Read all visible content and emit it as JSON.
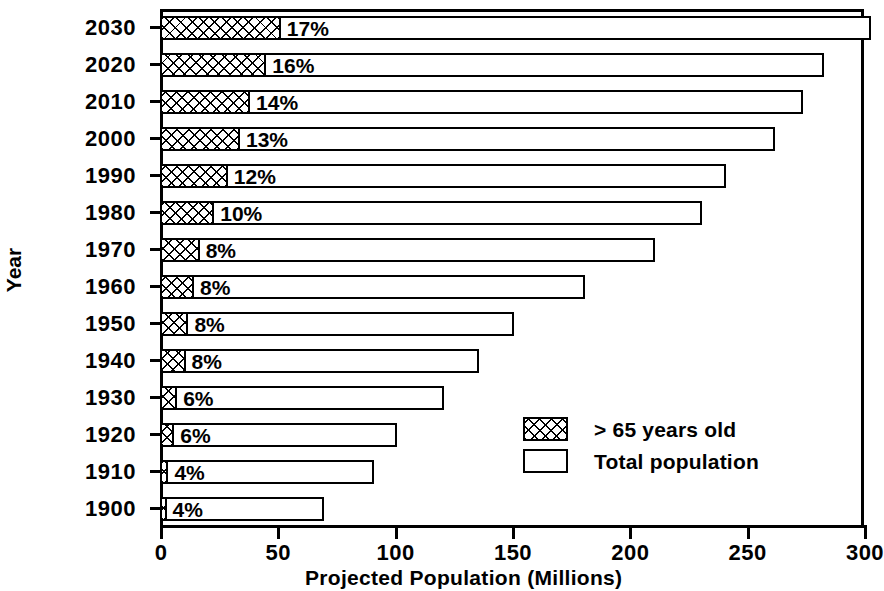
{
  "chart_data": {
    "type": "bar",
    "orientation": "horizontal",
    "title": "",
    "xlabel": "Projected Population (Millions)",
    "ylabel": "Year",
    "xlim": [
      0,
      300
    ],
    "xticks": [
      0,
      50,
      100,
      150,
      200,
      250,
      300
    ],
    "xtick_labels": [
      "0",
      "50",
      "100",
      "150",
      "200",
      "250",
      "300"
    ],
    "grid": false,
    "legend_position": "inside-lower-right",
    "categories": [
      "2030",
      "2020",
      "2010",
      "2000",
      "1990",
      "1980",
      "1970",
      "1960",
      "1950",
      "1940",
      "1930",
      "1920",
      "1910",
      "1900"
    ],
    "series": [
      {
        "name": "Total population",
        "values": [
          303,
          283,
          274,
          262,
          241,
          231,
          211,
          181,
          151,
          136,
          121,
          101,
          91,
          70
        ]
      },
      {
        "name": "> 65 years old",
        "values": [
          51.5,
          45.3,
          38.4,
          34.1,
          28.9,
          23.1,
          16.9,
          14.5,
          12.1,
          10.9,
          7.3,
          6.1,
          3.6,
          2.8
        ]
      }
    ],
    "data_labels": [
      "17%",
      "16%",
      "14%",
      "13%",
      "12%",
      "10%",
      "8%",
      "8%",
      "8%",
      "8%",
      "6%",
      "6%",
      "4%",
      "4%"
    ],
    "bars": [
      {
        "year": "2030",
        "total": 303,
        "elderly": 51.5,
        "pct": "17%"
      },
      {
        "year": "2020",
        "total": 283,
        "elderly": 45.3,
        "pct": "16%"
      },
      {
        "year": "2010",
        "total": 274,
        "elderly": 38.4,
        "pct": "14%"
      },
      {
        "year": "2000",
        "total": 262,
        "elderly": 34.1,
        "pct": "13%"
      },
      {
        "year": "1990",
        "total": 241,
        "elderly": 28.9,
        "pct": "12%"
      },
      {
        "year": "1980",
        "total": 231,
        "elderly": 23.1,
        "pct": "10%"
      },
      {
        "year": "1970",
        "total": 211,
        "elderly": 16.9,
        "pct": "8%"
      },
      {
        "year": "1960",
        "total": 181,
        "elderly": 14.5,
        "pct": "8%"
      },
      {
        "year": "1950",
        "total": 151,
        "elderly": 12.1,
        "pct": "8%"
      },
      {
        "year": "1940",
        "total": 136,
        "elderly": 10.9,
        "pct": "8%"
      },
      {
        "year": "1930",
        "total": 121,
        "elderly": 7.3,
        "pct": "6%"
      },
      {
        "year": "1920",
        "total": 101,
        "elderly": 6.1,
        "pct": "6%"
      },
      {
        "year": "1910",
        "total": 91,
        "elderly": 3.6,
        "pct": "4%"
      },
      {
        "year": "1900",
        "total": 70,
        "elderly": 2.8,
        "pct": "4%"
      }
    ],
    "legend": [
      {
        "label": "> 65 years old",
        "swatch": "hatched"
      },
      {
        "label": "Total population",
        "swatch": "open"
      }
    ]
  },
  "colors": {
    "ink": "#000000",
    "paper": "#ffffff"
  }
}
